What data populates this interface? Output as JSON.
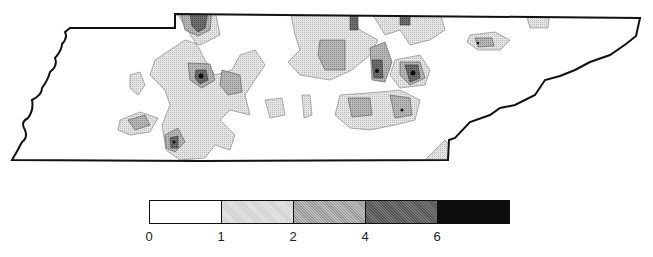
{
  "map": {
    "region": "Tennessee",
    "type": "contour density map",
    "outline_color": "#111111"
  },
  "legend": {
    "bins": [
      {
        "range": "0-1",
        "color": "#ffffff"
      },
      {
        "range": "1-2",
        "color": "#d9d9d9"
      },
      {
        "range": "2-4",
        "color": "#ababab"
      },
      {
        "range": "4-6",
        "color": "#6a6a6a"
      },
      {
        "range": "6+",
        "color": "#0d0d0d"
      }
    ],
    "ticks": [
      "0",
      "1",
      "2",
      "4",
      "6"
    ]
  }
}
